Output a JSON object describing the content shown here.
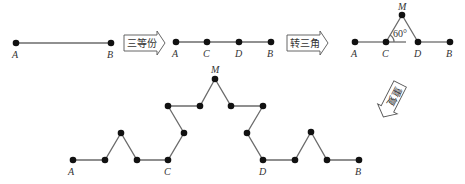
{
  "diagram": {
    "colors": {
      "line": "#6b6b6b",
      "point": "#111111",
      "text": "#333333"
    },
    "stage1": {
      "labels": {
        "A": "A",
        "B": "B"
      }
    },
    "arrow1": {
      "label": "三等份"
    },
    "stage2": {
      "labels": {
        "A": "A",
        "C": "C",
        "D": "D",
        "B": "B"
      }
    },
    "arrow2": {
      "label": "转三角"
    },
    "stage3": {
      "labels": {
        "A": "A",
        "C": "C",
        "D": "D",
        "B": "B",
        "M": "M"
      },
      "angle": "60°"
    },
    "arrow3": {
      "label": "重复"
    },
    "stage4": {
      "labels": {
        "A": "A",
        "C": "C",
        "D": "D",
        "B": "B",
        "M": "M"
      }
    }
  }
}
